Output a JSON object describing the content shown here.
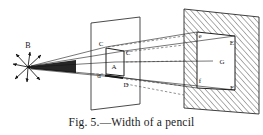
{
  "figure": {
    "caption": "Fig. 5.—Width of a pencil",
    "title": "Width of a pencil",
    "number": "Fig. 5.",
    "background_color": "#ffffff",
    "ink_color": "#141414"
  },
  "source_point": {
    "label": "B",
    "description": "radiating-point-source",
    "ray_count": 8
  },
  "aperture_plane": {
    "name": "middle-plane",
    "labels": {
      "outer_top_left": "C",
      "inner_top_right": "C",
      "center": "A",
      "outer_left": "d",
      "inner_bottom_right": "D"
    }
  },
  "screen_plane": {
    "name": "right-screen-hatched",
    "hatched": true,
    "labels": {
      "inner_top_left": "e",
      "inner_top_right": "E",
      "center": "G",
      "inner_bottom_left": "f",
      "inner_bottom_right": "F"
    },
    "center_marker": "—"
  }
}
